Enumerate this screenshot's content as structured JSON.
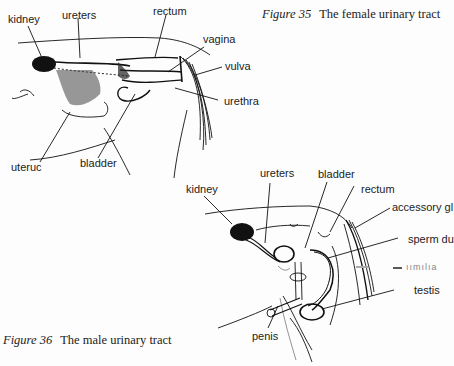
{
  "figures": [
    {
      "number_label": "Figure 35",
      "caption": "The female urinary tract",
      "labels": {
        "kidney": "kidney",
        "ureters": "ureters",
        "rectum": "rectum",
        "vagina": "vagina",
        "vulva": "vulva",
        "urethra": "urethra",
        "uterus": "uteruc",
        "bladder": "bladder"
      }
    },
    {
      "number_label": "Figure 36",
      "caption": "The male urinary tract",
      "labels": {
        "kidney": "kidney",
        "ureters": "ureters",
        "bladder": "bladder",
        "rectum": "rectum",
        "accessory_gland": "accessory gl",
        "sperm_duct": "sperm du",
        "urethra_faded": "ıımılıa",
        "testis": "testis",
        "penis": "penis"
      }
    }
  ]
}
